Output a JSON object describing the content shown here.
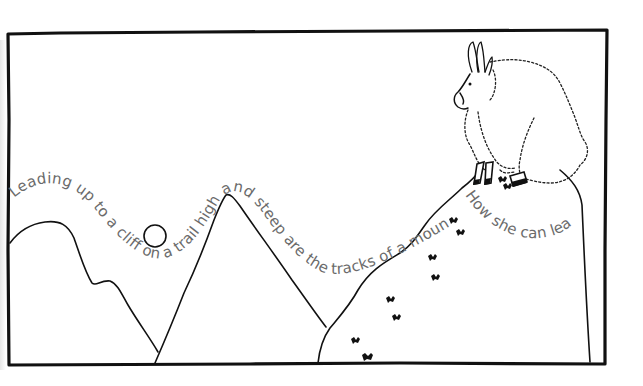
{
  "illustration": {
    "caption_main": "Leading up to a cliff on a trail high and steep are the tracks of a mountain goat.",
    "caption_goat": "How she can leap!",
    "subject": "mountain goat on a cliff top",
    "elements": [
      "frame",
      "mountains",
      "sun",
      "cliff",
      "goat",
      "hoof-tracks"
    ],
    "colors": {
      "ink": "#111111",
      "caption_text": "#6b6b6b",
      "background": "#ffffff"
    }
  }
}
